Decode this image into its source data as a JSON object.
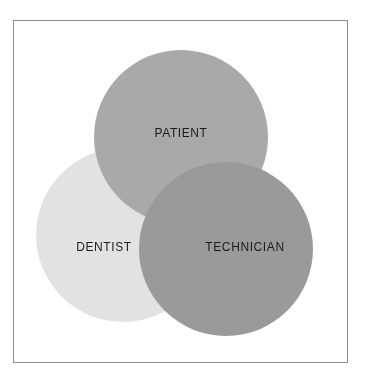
{
  "page": {
    "background_color": "#ffffff",
    "frame_border_color": "#8d8d8d"
  },
  "chart_data": {
    "type": "venn",
    "title": "",
    "subtitle": "",
    "xlabel": "",
    "ylabel": "",
    "grid": false,
    "legend_position": "none",
    "set_count": 3,
    "blend_mode": "multiply",
    "sets": [
      {
        "id": "patient",
        "label": "PATIENT",
        "color": "#a9a9a9",
        "opacity": 1,
        "cx": 181,
        "cy": 137,
        "r": 87,
        "label_x": 181,
        "label_y": 133,
        "position": "top-center"
      },
      {
        "id": "dentist",
        "label": "DENTIST",
        "color": "#e2e2e2",
        "opacity": 1,
        "cx": 123,
        "cy": 235,
        "r": 87,
        "label_x": 104,
        "label_y": 247,
        "position": "bottom-left"
      },
      {
        "id": "technician",
        "label": "TECHNICIAN",
        "color": "#9a9a9a",
        "opacity": 1,
        "cx": 226,
        "cy": 249,
        "r": 87,
        "label_x": 245,
        "label_y": 247,
        "position": "bottom-right"
      }
    ],
    "intersections": [
      {
        "id": "patient-technician",
        "sets": [
          "patient",
          "technician"
        ],
        "color": "#6e6e6e",
        "label": ""
      },
      {
        "id": "patient-dentist",
        "sets": [
          "patient",
          "dentist"
        ],
        "color": "#9a9a9a",
        "label": ""
      },
      {
        "id": "dentist-technician",
        "sets": [
          "dentist",
          "technician"
        ],
        "color": "#8b8b8b",
        "label": ""
      },
      {
        "id": "patient-dentist-technician",
        "sets": [
          "patient",
          "dentist",
          "technician"
        ],
        "color": "#636363",
        "label": ""
      }
    ],
    "label_color": "#1c1c1c",
    "label_font_size": 12
  }
}
